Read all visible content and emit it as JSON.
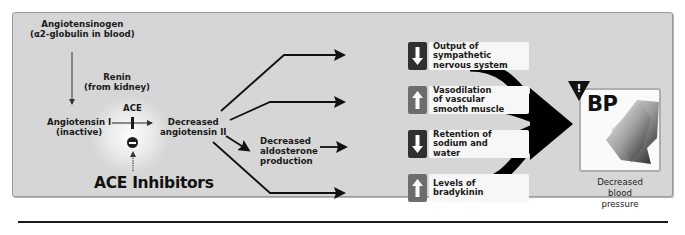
{
  "diagram": {
    "pathway": {
      "precursor": {
        "line1": "Angiotensinogen",
        "line2": "(α2-globulin in blood)"
      },
      "enzyme_renin": {
        "line1": "Renin",
        "line2": "(from kidney)"
      },
      "angiotensin_i": {
        "line1": "Angiotensin I",
        "line2": "(inactive)"
      },
      "enzyme_ace": "ACE",
      "product": {
        "line1": "Decreased",
        "line2": "angiotensin II"
      },
      "aldosterone": {
        "line1": "Decreased",
        "line2": "aldosterone",
        "line3": "production"
      },
      "inhibitor": "ACE Inhibitors",
      "inhibitor_symbol": "minus-circle"
    },
    "effects": [
      {
        "direction": "down",
        "icon": "down-arrow-icon",
        "lines": [
          "Output of",
          "sympathetic",
          "nervous system"
        ]
      },
      {
        "direction": "up",
        "icon": "up-arrow-icon",
        "lines": [
          "Vasodilation",
          "of vascular",
          "smooth muscle"
        ]
      },
      {
        "direction": "down",
        "icon": "down-arrow-icon",
        "lines": [
          "Retention of",
          "sodium and",
          "water"
        ]
      },
      {
        "direction": "up",
        "icon": "up-arrow-icon",
        "lines": [
          "Levels of",
          "bradykinin"
        ]
      }
    ],
    "outcome": {
      "badge": "BP",
      "warning_symbol": "!",
      "caption": {
        "line1": "Decreased",
        "line2": "blood",
        "line3": "pressure"
      }
    },
    "colors": {
      "panel_bg": "#d6d6d6",
      "down_box": "#303030",
      "up_box": "#6d6d6d",
      "effect_label_bg": "#f7f7f7",
      "arrow": "#000000"
    }
  }
}
